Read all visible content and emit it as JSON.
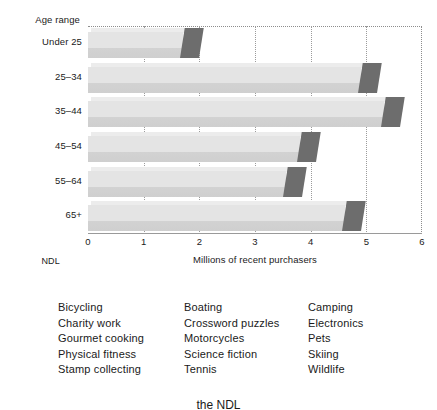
{
  "chart_data": {
    "type": "bar",
    "orientation": "horizontal",
    "title": "",
    "xlabel": "Millions of recent purchasers",
    "ylabel": "Age range",
    "categories": [
      "Under 25",
      "25–34",
      "35–44",
      "45–54",
      "55–64",
      "65+"
    ],
    "values": [
      2.0,
      5.2,
      5.6,
      4.1,
      3.85,
      4.9
    ],
    "xlim": [
      0,
      6
    ],
    "xticks": [
      "0",
      "1",
      "2",
      "3",
      "4",
      "5",
      "6"
    ],
    "grid": true,
    "legend": "none",
    "style": "3d-shaded-bars",
    "bar_color": "#e4e4e4",
    "bar_cap_color": "#6d6d6d"
  },
  "axes": {
    "y_axis_title": "Age range",
    "x_axis_title": "Millions of recent purchasers",
    "corner_label": "NDL"
  },
  "interest_list": {
    "columns": [
      [
        "Bicycling",
        "Charity work",
        "Gourmet cooking",
        "Physical fitness",
        "Stamp collecting"
      ],
      [
        "Boating",
        "Crossword puzzles",
        "Motorcycles",
        "Science fiction",
        "Tennis"
      ],
      [
        "Camping",
        "Electronics",
        "Pets",
        "Skiing",
        "Wildlife"
      ]
    ]
  },
  "caption": "the NDL"
}
